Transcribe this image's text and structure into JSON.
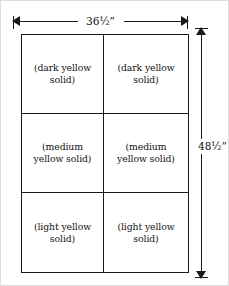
{
  "diagram": {
    "line_color": "#1a1a1a",
    "background_color": "#ffffff",
    "dimensions": {
      "width_label": "36½”",
      "height_label": "48½”",
      "width_value": "36.5",
      "height_value": "48.5",
      "unit": "inches"
    },
    "grid": {
      "columns": 2,
      "rows": 3
    },
    "cells": [
      {
        "row": 1,
        "column": 1,
        "line1": "(dark yellow",
        "line2": "solid)"
      },
      {
        "row": 1,
        "column": 2,
        "line1": "(dark yellow",
        "line2": "solid)"
      },
      {
        "row": 2,
        "column": 1,
        "line1": "(medium",
        "line2": "yellow solid)"
      },
      {
        "row": 2,
        "column": 2,
        "line1": "(medium",
        "line2": "yellow solid)"
      },
      {
        "row": 3,
        "column": 1,
        "line1": "(light yellow",
        "line2": "solid)"
      },
      {
        "row": 3,
        "column": 2,
        "line1": "(light yellow",
        "line2": "solid)"
      }
    ]
  }
}
